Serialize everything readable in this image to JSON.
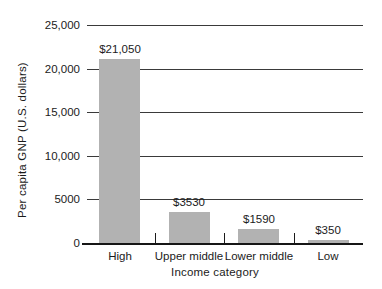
{
  "figure": {
    "background_color": "#ffffff",
    "text_color": "#1b1b1b"
  },
  "chart_data": {
    "type": "bar",
    "title": "",
    "categories": [
      "High",
      "Upper middle",
      "Lower middle",
      "Low"
    ],
    "values": [
      21050,
      3530,
      1590,
      350
    ],
    "value_labels": [
      "$21,050",
      "$3530",
      "$1590",
      "$350"
    ],
    "xlabel": "Income category",
    "ylabel": "Per capita GNP (U.S. dollars)",
    "ylim": [
      0,
      25000
    ],
    "ytick_step": 5000,
    "ytick_labels": [
      "0",
      "5000",
      "10,000",
      "15,000",
      "20,000",
      "25,000"
    ],
    "grid": "horizontal gridlines at each y tick",
    "legend_position": "none",
    "bar_color": "#b2b2b2",
    "gridline_color": "#3a3a3a",
    "axis_color": "#161616"
  }
}
